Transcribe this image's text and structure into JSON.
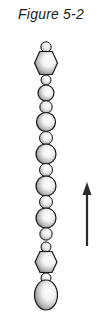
{
  "figure": {
    "title": "Figure 5-2",
    "background_color": "#ffffff",
    "outline_color": "#1a1a1a",
    "fill_highlight_color": "#ffffff",
    "fill_shadow_color": "#6b6b6b",
    "width": 108,
    "height": 317
  },
  "chain": {
    "label": "bead-chain",
    "center_x": 46,
    "beads": [
      {
        "name": "bead-1",
        "shape": "circle",
        "cx": 46,
        "cy": 47,
        "rx": 5.2,
        "ry": 5.2
      },
      {
        "name": "bead-2",
        "shape": "hexagon",
        "cx": 46,
        "cy": 63,
        "rx": 11.5,
        "ry": 11.5
      },
      {
        "name": "bead-3",
        "shape": "circle",
        "cx": 46,
        "cy": 80,
        "rx": 5.0,
        "ry": 5.0
      },
      {
        "name": "bead-4",
        "shape": "circle",
        "cx": 46,
        "cy": 93,
        "rx": 8.0,
        "ry": 8.0
      },
      {
        "name": "bead-5",
        "shape": "circle",
        "cx": 46,
        "cy": 107,
        "rx": 6.2,
        "ry": 6.2
      },
      {
        "name": "bead-6",
        "shape": "circle",
        "cx": 46,
        "cy": 122,
        "rx": 9.5,
        "ry": 9.5
      },
      {
        "name": "bead-7",
        "shape": "circle",
        "cx": 46,
        "cy": 138,
        "rx": 6.5,
        "ry": 6.5
      },
      {
        "name": "bead-8",
        "shape": "circle",
        "cx": 46,
        "cy": 154,
        "rx": 10.0,
        "ry": 10.0
      },
      {
        "name": "bead-9",
        "shape": "circle",
        "cx": 46,
        "cy": 170,
        "rx": 6.5,
        "ry": 6.5
      },
      {
        "name": "bead-10",
        "shape": "circle",
        "cx": 46,
        "cy": 186,
        "rx": 10.0,
        "ry": 10.0
      },
      {
        "name": "bead-11",
        "shape": "circle",
        "cx": 46,
        "cy": 202,
        "rx": 6.5,
        "ry": 6.5
      },
      {
        "name": "bead-12",
        "shape": "circle",
        "cx": 46,
        "cy": 218,
        "rx": 10.0,
        "ry": 10.0
      },
      {
        "name": "bead-13",
        "shape": "circle",
        "cx": 46,
        "cy": 234,
        "rx": 6.2,
        "ry": 6.2
      },
      {
        "name": "bead-14",
        "shape": "circle",
        "cx": 46,
        "cy": 247,
        "rx": 5.0,
        "ry": 5.0
      },
      {
        "name": "bead-15",
        "shape": "hexagon",
        "cx": 46,
        "cy": 262,
        "rx": 11.0,
        "ry": 10.5
      },
      {
        "name": "bead-16",
        "shape": "circle",
        "cx": 46,
        "cy": 278,
        "rx": 5.0,
        "ry": 5.0
      },
      {
        "name": "bead-17",
        "shape": "ellipse",
        "cx": 46,
        "cy": 295,
        "rx": 11.5,
        "ry": 15.0
      }
    ]
  },
  "arrow": {
    "name": "upward-arrow",
    "direction": "up",
    "x": 87,
    "tip_y": 182,
    "tail_y": 246,
    "head_width": 9,
    "head_height": 13,
    "shaft_width": 2.2,
    "color": "#2b2b2b"
  }
}
